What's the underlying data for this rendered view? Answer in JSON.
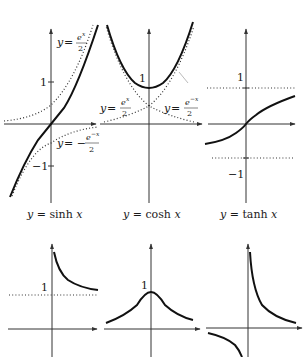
{
  "figure": {
    "panels": [
      {
        "id": "sinh",
        "caption": "y = sinh x",
        "caption_parts": {
          "lhs": "y",
          "eq": " = ",
          "fn": "sinh ",
          "var": "x"
        },
        "ticks": {
          "pos": "1",
          "neg": "−1"
        },
        "asymptote_labels": [
          {
            "lhs": "y = ",
            "num": "e",
            "sup": "x",
            "den": "2"
          },
          {
            "lhs": "y = − ",
            "num": "e",
            "sup": "−x",
            "den": "2"
          }
        ]
      },
      {
        "id": "cosh",
        "caption": "y = cosh x",
        "caption_parts": {
          "lhs": "y",
          "eq": " = ",
          "fn": "cosh ",
          "var": "x"
        },
        "ticks": {
          "pos": "1"
        },
        "asymptote_labels": [
          {
            "lhs": "y = ",
            "num": "e",
            "sup": "x",
            "den": "2"
          },
          {
            "lhs": "y = ",
            "num": "e",
            "sup": "−x",
            "den": "2"
          }
        ]
      },
      {
        "id": "tanh",
        "caption": "y = tanh x",
        "caption_parts": {
          "lhs": "y",
          "eq": " = ",
          "fn": "tanh ",
          "var": "x"
        },
        "ticks": {
          "pos": "1",
          "neg": "−1"
        }
      },
      {
        "id": "coth-positive-branch",
        "ticks": {
          "pos": "1"
        }
      },
      {
        "id": "sech",
        "ticks": {
          "pos": "1"
        }
      },
      {
        "id": "csch"
      }
    ],
    "colors": {
      "curve": "#111111",
      "axis": "#333333",
      "dotted": "#333333",
      "background": "#ffffff"
    }
  }
}
